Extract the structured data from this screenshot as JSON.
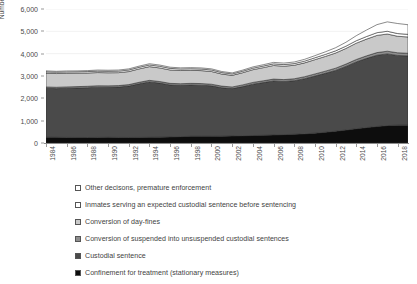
{
  "chart": {
    "type": "area",
    "y_axis_title": "Number of executed sentences",
    "x_axis_title": ""
  },
  "y_ticks": [
    "0",
    "1,000",
    "2,000",
    "3,000",
    "4,000",
    "5,000",
    "6,000"
  ],
  "x_ticks": [
    "1984",
    "1986",
    "1988",
    "1990",
    "1992",
    "1994",
    "1996",
    "1998",
    "2000",
    "2002",
    "2004",
    "2006",
    "2008",
    "2010",
    "2012",
    "2014",
    "2016",
    "2018"
  ],
  "legend": {
    "items": [
      {
        "label": "Other decisons, premature enforcement",
        "color": "#ffffff"
      },
      {
        "label": "Inmates serving an expected custodial sentence before sentencing",
        "color": "#ffffff"
      },
      {
        "label": "Conversion of day-fines",
        "color": "#c9c9c9"
      },
      {
        "label": "Conversion of suspended into unsuspended custodial sentences",
        "color": "#8e8e8e"
      },
      {
        "label": "Custodial sentence",
        "color": "#4a4a4a"
      },
      {
        "label": "Confinement for treatment (stationary measures)",
        "color": "#0d0d0d"
      }
    ]
  },
  "chart_data": {
    "type": "area",
    "stacked": true,
    "title": "",
    "xlabel": "",
    "ylabel": "Number of executed sentences",
    "ylim": [
      0,
      6000
    ],
    "grid": true,
    "legend_position": "bottom",
    "x": [
      1984,
      1985,
      1986,
      1987,
      1988,
      1989,
      1990,
      1991,
      1992,
      1993,
      1994,
      1995,
      1996,
      1997,
      1998,
      1999,
      2000,
      2001,
      2002,
      2003,
      2004,
      2005,
      2006,
      2007,
      2008,
      2009,
      2010,
      2011,
      2012,
      2013,
      2014,
      2015,
      2016,
      2017,
      2018,
      2019
    ],
    "series": [
      {
        "name": "Confinement for treatment (stationary measures)",
        "color": "#0d0d0d",
        "values": [
          260,
          255,
          250,
          248,
          245,
          250,
          255,
          250,
          248,
          250,
          255,
          262,
          270,
          285,
          300,
          300,
          300,
          305,
          315,
          325,
          335,
          345,
          360,
          375,
          390,
          410,
          440,
          480,
          530,
          580,
          640,
          690,
          740,
          780,
          800,
          800
        ]
      },
      {
        "name": "Custodial sentence",
        "color": "#4a4a4a",
        "values": [
          2190,
          2180,
          2200,
          2215,
          2230,
          2250,
          2240,
          2255,
          2300,
          2400,
          2480,
          2420,
          2330,
          2300,
          2300,
          2290,
          2260,
          2170,
          2120,
          2200,
          2300,
          2360,
          2420,
          2380,
          2400,
          2470,
          2560,
          2640,
          2720,
          2850,
          2990,
          3100,
          3190,
          3210,
          3120,
          3100
        ]
      },
      {
        "name": "Conversion of suspended into unsuspended custodial sentences",
        "color": "#8e8e8e",
        "values": [
          60,
          60,
          62,
          62,
          64,
          64,
          64,
          65,
          66,
          68,
          70,
          70,
          70,
          70,
          70,
          72,
          72,
          72,
          74,
          76,
          78,
          80,
          82,
          84,
          86,
          88,
          92,
          96,
          100,
          104,
          110,
          114,
          118,
          120,
          120,
          118
        ]
      },
      {
        "name": "Conversion of day-fines",
        "color": "#c9c9c9",
        "values": [
          620,
          615,
          610,
          600,
          595,
          590,
          585,
          580,
          585,
          600,
          615,
          610,
          600,
          590,
          585,
          580,
          570,
          540,
          520,
          545,
          570,
          590,
          610,
          600,
          605,
          620,
          640,
          660,
          680,
          700,
          730,
          750,
          770,
          770,
          740,
          730
        ]
      },
      {
        "name": "Inmates serving an expected custodial sentence before sentencing",
        "color": "#ffffff",
        "values": [
          60,
          60,
          62,
          62,
          64,
          66,
          66,
          68,
          70,
          72,
          74,
          74,
          72,
          70,
          70,
          70,
          68,
          66,
          64,
          66,
          68,
          70,
          72,
          72,
          74,
          78,
          84,
          90,
          96,
          102,
          110,
          116,
          122,
          124,
          120,
          118
        ]
      },
      {
        "name": "Other decisons, premature enforcement",
        "color": "#ffffff",
        "values": [
          40,
          40,
          42,
          42,
          44,
          46,
          48,
          48,
          50,
          52,
          54,
          54,
          52,
          50,
          50,
          50,
          50,
          48,
          46,
          50,
          55,
          60,
          65,
          68,
          72,
          80,
          95,
          115,
          140,
          175,
          225,
          290,
          360,
          420,
          450,
          430
        ]
      }
    ]
  }
}
